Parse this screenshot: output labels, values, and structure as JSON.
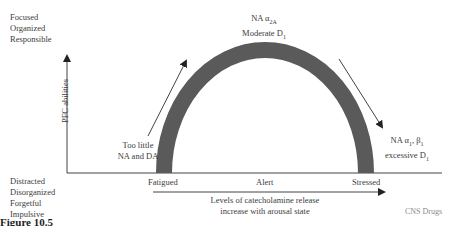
{
  "diagram": {
    "y_axis": {
      "label": "PFC abilities",
      "top_labels": [
        "Focused",
        "Organized",
        "Responsible"
      ],
      "bottom_labels": [
        "Distracted",
        "Disorganized",
        "Forgetful",
        "Impulsive"
      ]
    },
    "x_axis": {
      "ticks": [
        "Fatigued",
        "Alert",
        "Stressed"
      ],
      "arrow_label_lines": [
        "Levels of catecholamine release",
        "increase with arousal state"
      ]
    },
    "curve": {
      "shape": "inverted-U",
      "color": "#5a5a5a"
    },
    "annotations": {
      "peak": {
        "line1_prefix": "NA α",
        "line1_sub": "2A",
        "line2_prefix": "Moderate D",
        "line2_sub": "1"
      },
      "left": {
        "lines": [
          "Too little",
          "NA and DA"
        ]
      },
      "right": {
        "line1_prefix": "NA α",
        "line1_sub1": "1",
        "line1_mid": ", β",
        "line1_sub2": "1",
        "line2_prefix": "excessive D",
        "line2_sub": "1"
      }
    },
    "source": "CNS Drugs",
    "caption_partial": "Figure 10.5"
  }
}
